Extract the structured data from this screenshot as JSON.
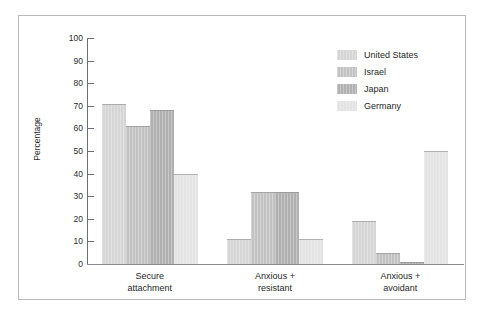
{
  "chart_data": {
    "type": "bar",
    "title": "",
    "subtitle": "",
    "xlabel": "",
    "ylabel": "Percentage",
    "ylim": [
      0,
      100
    ],
    "yticks": [
      0,
      10,
      20,
      30,
      40,
      50,
      60,
      70,
      80,
      90,
      100
    ],
    "grid": false,
    "legend_position": "top-right",
    "categories": [
      "Secure attachment",
      "Anxious + resistant",
      "Anxious + avoidant"
    ],
    "category_lines": [
      [
        "Secure",
        "attachment"
      ],
      [
        "Anxious +",
        "resistant"
      ],
      [
        "Anxious +",
        "avoidant"
      ]
    ],
    "series": [
      {
        "name": "United States",
        "color": "#d5d5d5",
        "values": [
          71,
          11,
          19
        ]
      },
      {
        "name": "Israel",
        "color": "#c2c2c2",
        "values": [
          61,
          32,
          5
        ]
      },
      {
        "name": "Japan",
        "color": "#b0b0b0",
        "values": [
          68,
          32,
          1
        ]
      },
      {
        "name": "Germany",
        "color": "#e3e3e3",
        "values": [
          40,
          11,
          50
        ]
      }
    ]
  },
  "legend": {
    "items": [
      {
        "label": "United States",
        "color": "#d5d5d5"
      },
      {
        "label": "Israel",
        "color": "#c2c2c2"
      },
      {
        "label": "Japan",
        "color": "#b0b0b0"
      },
      {
        "label": "Germany",
        "color": "#e3e3e3"
      }
    ]
  },
  "axis": {
    "y_title": "Percentage",
    "tick_labels": [
      "100",
      "90",
      "80",
      "70",
      "60",
      "50",
      "40",
      "30",
      "20",
      "10",
      "0"
    ]
  }
}
